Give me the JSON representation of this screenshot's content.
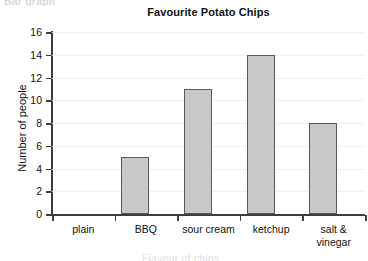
{
  "page": {
    "clipped_top_text": "Bar graph",
    "clipped_bottom_text": "Flavour of chips"
  },
  "chart_data": {
    "type": "bar",
    "title": "Favourite Potato Chips",
    "xlabel": "",
    "ylabel": "Number of people",
    "categories": [
      "plain",
      "BBQ",
      "sour cream",
      "ketchup",
      "salt &\nvinegar"
    ],
    "values": [
      5,
      11,
      14,
      8,
      12
    ],
    "ylim": [
      0,
      16
    ],
    "ytick_step": 2,
    "yticks": [
      0,
      2,
      4,
      6,
      8,
      10,
      12,
      14,
      16
    ],
    "ytick_labels": [
      "0",
      "2",
      "4",
      "6",
      "8",
      "10",
      "12",
      "14",
      "16"
    ],
    "grid": true,
    "grid_axis": "y",
    "legend": false,
    "bar_fill_color": "#c8c8c8",
    "bar_edge_color": "#5a5a5a",
    "axis_color": "#3d3d3d",
    "gridline_color": "#f0f0f0"
  }
}
